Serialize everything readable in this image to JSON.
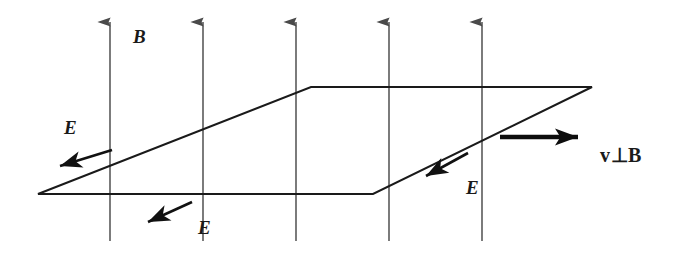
{
  "figure": {
    "type": "physics-vector-diagram",
    "background_color": "#ffffff",
    "width": 677,
    "height": 253
  },
  "colors": {
    "field_line": "#5b5b5b",
    "field_arrowhead": "#4a4a4a",
    "plane_outline": "#1a1a1a",
    "e_vector": "#111111",
    "v_vector": "#0d0d0d",
    "label_text": "#1a1a1a"
  },
  "labels": {
    "magnetic_field": "B",
    "electric_field_left": "E",
    "electric_field_bottom": "E",
    "electric_field_right": "E",
    "velocity": "v⊥B"
  },
  "field_lines": {
    "count": 5,
    "direction": "up",
    "x_positions": [
      110,
      203,
      296,
      389,
      482
    ],
    "y_top": 16,
    "y_bottom": 241
  },
  "plane": {
    "shape": "parallelogram",
    "vertices": [
      {
        "name": "left",
        "x": 38,
        "y": 194
      },
      {
        "name": "top-left",
        "x": 311,
        "y": 87
      },
      {
        "name": "top-right",
        "x": 592,
        "y": 87
      },
      {
        "name": "bottom-right",
        "x": 373,
        "y": 194
      }
    ]
  },
  "vectors": [
    {
      "name": "E-left",
      "label": "E",
      "from": {
        "x": 112,
        "y": 150
      },
      "to": {
        "x": 47,
        "y": 170
      },
      "label_pos": {
        "x": 64,
        "y": 118
      }
    },
    {
      "name": "E-bottom",
      "label": "E",
      "from": {
        "x": 192,
        "y": 202
      },
      "to": {
        "x": 134,
        "y": 228
      },
      "label_pos": {
        "x": 198,
        "y": 218
      }
    },
    {
      "name": "E-right",
      "label": "E",
      "from": {
        "x": 468,
        "y": 153
      },
      "to": {
        "x": 412,
        "y": 184
      },
      "label_pos": {
        "x": 466,
        "y": 178
      }
    },
    {
      "name": "velocity",
      "label": "v⊥B",
      "from": {
        "x": 500,
        "y": 137
      },
      "to": {
        "x": 596,
        "y": 137
      },
      "label_pos": {
        "x": 600,
        "y": 145
      }
    }
  ]
}
